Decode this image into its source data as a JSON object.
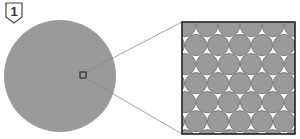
{
  "diagram": {
    "step_label": "1",
    "colors": {
      "circle_fill": "#9a9a9a",
      "outline": "#333333",
      "connector": "#888888",
      "background": "#ffffff"
    },
    "main_circle": {
      "cx": 60,
      "cy": 76,
      "r": 56
    },
    "focus_box": {
      "x": 80,
      "y": 72,
      "size": 6
    },
    "zoom_panel": {
      "x": 182,
      "y": 22,
      "w": 113,
      "h": 112
    },
    "packing": {
      "type": "hexagonal",
      "circle_diameter": 22,
      "rows": 6
    }
  }
}
